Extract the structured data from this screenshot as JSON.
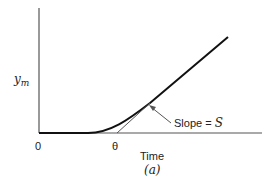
{
  "figure": {
    "y_axis_label_base": "y",
    "y_axis_label_sub": "m",
    "x_axis_label": "Time",
    "caption": "(a)",
    "origin_label": "0",
    "theta_label": "θ",
    "slope_label_text": "Slope = ",
    "slope_symbol": "S"
  },
  "colors": {
    "axis": "#555555",
    "curve": "#111111",
    "tangent": "#555555"
  }
}
